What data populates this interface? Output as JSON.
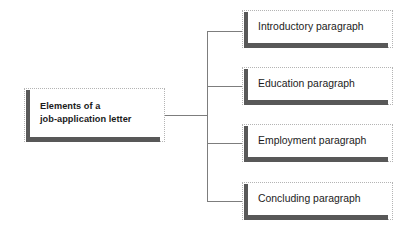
{
  "diagram": {
    "type": "hierarchy-tree",
    "title": "Elements of a job-application letter",
    "orientation": "left-to-right",
    "colors": {
      "accent_bar": "#585858",
      "connector_line": "#7d7d7d",
      "box_outline": "#b4b4b4",
      "box_fill": "#ffffff",
      "text": "#1b1b1b"
    },
    "root": {
      "label": "Elements of a\njob-application letter",
      "line1": "Elements of a",
      "line2": "job-application letter"
    },
    "children": [
      {
        "label": "Introductory paragraph"
      },
      {
        "label": "Education paragraph"
      },
      {
        "label": "Employment paragraph"
      },
      {
        "label": "Concluding paragraph"
      }
    ]
  }
}
